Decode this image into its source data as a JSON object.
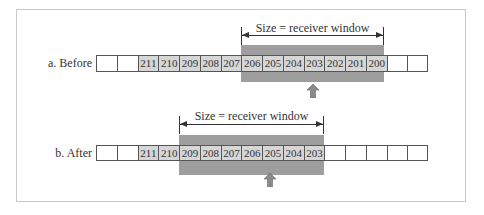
{
  "diagram": {
    "colors": {
      "window_band": "#9e9e9e",
      "shaded_cell": "#d6d6d6",
      "border": "#555555",
      "pointer": "#8a8a8a"
    },
    "before": {
      "label": "a. Before",
      "window_label": "Size = receiver window",
      "cells": [
        "",
        "",
        "211",
        "210",
        "209",
        "208",
        "207",
        "206",
        "205",
        "204",
        "203",
        "202",
        "201",
        "200",
        "",
        ""
      ],
      "window_range": [
        "206",
        "200"
      ],
      "pointer_at": "203"
    },
    "after": {
      "label": "b. After",
      "window_label": "Size = receiver window",
      "cells": [
        "",
        "",
        "211",
        "210",
        "209",
        "208",
        "207",
        "206",
        "205",
        "204",
        "203",
        "",
        "",
        "",
        "",
        ""
      ],
      "window_range": [
        "209",
        "203"
      ],
      "pointer_at": "205"
    }
  }
}
